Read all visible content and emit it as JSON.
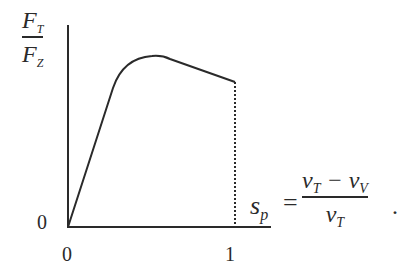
{
  "diagram": {
    "type": "line-sketch",
    "y_axis_label": {
      "numerator": "F",
      "numerator_sub": "T",
      "denominator": "F",
      "denominator_sub": "Z"
    },
    "y_tick_label": "0",
    "x_tick_labels": [
      "0",
      "1"
    ],
    "x_axis_label": {
      "symbol": "s",
      "sub": "p",
      "equals": "=",
      "numerator": "v",
      "numerator_sub1": "T",
      "minus": " − v",
      "numerator_sub2": "V",
      "denominator": "v",
      "denominator_sub": "T",
      "period": "."
    },
    "curve_description": "Linear rise from origin, rounded peak, then linear decline to s_p = 1; dotted vertical drop to axis at s_p = 1",
    "colors": {
      "line": "#2a2a2a",
      "background": "#ffffff"
    }
  }
}
